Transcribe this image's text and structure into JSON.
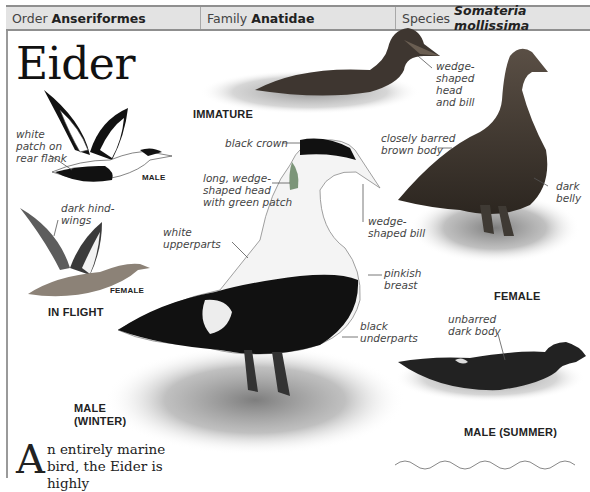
{
  "header": {
    "order_label": "Order",
    "order_value": "Anseriformes",
    "family_label": "Family",
    "family_value": "Anatidae",
    "species_label": "Species",
    "species_value": "Somateria mollissima"
  },
  "title": "Eider",
  "figures": {
    "immature": {
      "caption": "IMMATURE",
      "annotations": [
        "wedge-shaped head and bill"
      ]
    },
    "in_flight": {
      "caption": "IN FLIGHT",
      "male_label": "MALE",
      "female_label": "FEMALE",
      "annotations": [
        "white patch on rear flank",
        "dark hind-wings"
      ]
    },
    "male_winter": {
      "caption_line1": "MALE",
      "caption_line2": "(WINTER)",
      "annotations": [
        "black crown",
        "long, wedge-shaped head with green patch",
        "white upperparts",
        "wedge-shaped bill",
        "pinkish breast",
        "black underparts"
      ]
    },
    "female": {
      "caption": "FEMALE",
      "annotations": [
        "closely barred brown body",
        "dark belly"
      ]
    },
    "male_summer": {
      "caption": "MALE (SUMMER)",
      "annotations": [
        "unbarred dark body"
      ]
    }
  },
  "labels": {
    "wedge_head_1": "wedge-",
    "wedge_head_2": "shaped",
    "wedge_head_3": "head",
    "wedge_head_4": "and bill",
    "white_patch_1": "white",
    "white_patch_2": "patch on",
    "white_patch_3": "rear flank",
    "dark_hind_1": "dark hind-",
    "dark_hind_2": "wings",
    "black_crown": "black crown",
    "long_wedge_1": "long, wedge-",
    "long_wedge_2": "shaped head",
    "long_wedge_3": "with green patch",
    "white_upper_1": "white",
    "white_upper_2": "upperparts",
    "wedge_bill_1": "wedge-",
    "wedge_bill_2": "shaped bill",
    "pinkish_1": "pinkish",
    "pinkish_2": "breast",
    "black_under_1": "black",
    "black_under_2": "underparts",
    "barred_1": "closely barred",
    "barred_2": "brown body",
    "dark_belly_1": "dark",
    "dark_belly_2": "belly",
    "unbarred_1": "unbarred",
    "unbarred_2": "dark body"
  },
  "intro": {
    "dropcap": "A",
    "line1": "n entirely marine",
    "line2": "bird, the Eider is highly"
  },
  "colors": {
    "header_bg": "#e3e3e3",
    "header_border": "#8f8f8f",
    "text_dark": "#222222",
    "annotation": "#444444"
  }
}
